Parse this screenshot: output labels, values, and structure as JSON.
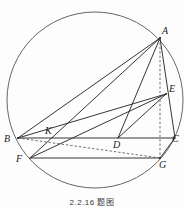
{
  "figure": {
    "caption": "2.2.16 题图",
    "stroke_color": "#2b2b2b",
    "circle_color": "#555555",
    "dashed_color": "#555555",
    "background": "#ffffff"
  },
  "circle": {
    "label": "circumcircle",
    "cx": 95,
    "cy": 100,
    "r": 88
  },
  "points": [
    {
      "id": "A",
      "label": "A",
      "x": 160,
      "y": 38,
      "lx": 162,
      "ly": 26
    },
    {
      "id": "B",
      "label": "B",
      "x": 18,
      "y": 138,
      "lx": 4,
      "ly": 134
    },
    {
      "id": "C",
      "label": "C",
      "x": 175,
      "y": 138,
      "lx": 172,
      "ly": 134
    },
    {
      "id": "D",
      "label": "D",
      "x": 118,
      "y": 138,
      "lx": 114,
      "ly": 140
    },
    {
      "id": "E",
      "label": "E",
      "x": 166,
      "y": 94,
      "lx": 169,
      "ly": 84
    },
    {
      "id": "F",
      "label": "F",
      "x": 30,
      "y": 158,
      "lx": 16,
      "ly": 154
    },
    {
      "id": "G",
      "label": "G",
      "x": 160,
      "y": 158,
      "lx": 160,
      "ly": 160
    },
    {
      "id": "K",
      "label": "K",
      "x": 52,
      "y": 138,
      "lx": 46,
      "ly": 126
    }
  ],
  "segments": [
    {
      "name": "AB",
      "from": "A",
      "to": "B",
      "style": "solid"
    },
    {
      "name": "AC",
      "from": "A",
      "to": "C",
      "style": "solid"
    },
    {
      "name": "BC",
      "from": "B",
      "to": "C",
      "style": "solid"
    },
    {
      "name": "AD",
      "from": "A",
      "to": "D",
      "style": "solid"
    },
    {
      "name": "AF",
      "from": "A",
      "to": "F",
      "style": "solid"
    },
    {
      "name": "BE",
      "from": "B",
      "to": "E",
      "style": "solid"
    },
    {
      "name": "DE",
      "from": "D",
      "to": "E",
      "style": "solid"
    },
    {
      "name": "EF",
      "from": "E",
      "to": "F",
      "style": "solid"
    },
    {
      "name": "FG",
      "from": "F",
      "to": "G",
      "style": "solid"
    },
    {
      "name": "CG",
      "from": "C",
      "to": "G",
      "style": "solid"
    },
    {
      "name": "BG",
      "from": "B",
      "to": "G",
      "style": "dashed"
    },
    {
      "name": "AG",
      "from": "A",
      "to": "G",
      "style": "dashed"
    }
  ]
}
